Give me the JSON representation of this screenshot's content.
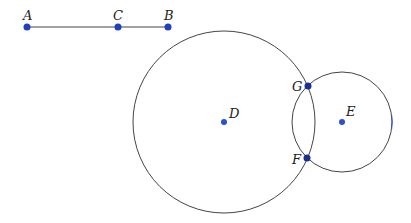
{
  "diagram": {
    "segment": {
      "from": "A",
      "to": "B",
      "color": "#444444"
    },
    "points": {
      "A": {
        "label": "A",
        "x": 27,
        "y": 27
      },
      "C": {
        "label": "C",
        "x": 118,
        "y": 27
      },
      "B": {
        "label": "B",
        "x": 168,
        "y": 27
      },
      "D": {
        "label": "D",
        "x": 224,
        "y": 122
      },
      "E": {
        "label": "E",
        "x": 342,
        "y": 122
      },
      "G": {
        "label": "G",
        "x": 308,
        "y": 86
      },
      "F": {
        "label": "F",
        "x": 307,
        "y": 158
      }
    },
    "circles": [
      {
        "center": "D",
        "r": 91
      },
      {
        "center": "E",
        "r": 50
      }
    ],
    "colors": {
      "point": "#1f3fbf",
      "stroke": "#444444",
      "intersection": "#1a2f8f"
    }
  }
}
